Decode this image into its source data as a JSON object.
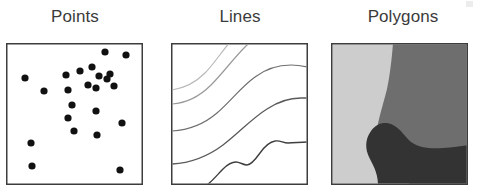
{
  "figure": {
    "background_color": "#ffffff",
    "width": 481,
    "height": 195,
    "panel_count": 3
  },
  "panels": [
    {
      "id": "points",
      "title": "Points",
      "title_color": "#3b3b3b",
      "frame_color": "#3d3d3d",
      "fill_color": "#ffffff",
      "geometry_type": "point",
      "marker_color": "#111111",
      "marker_radius": 3.6,
      "point_count": 24,
      "points": [
        [
          19,
          35
        ],
        [
          38,
          48
        ],
        [
          60,
          32
        ],
        [
          62,
          47
        ],
        [
          66,
          62
        ],
        [
          74,
          28
        ],
        [
          82,
          42
        ],
        [
          86,
          24
        ],
        [
          90,
          45
        ],
        [
          93,
          33
        ],
        [
          99,
          9
        ],
        [
          101,
          36
        ],
        [
          104,
          31
        ],
        [
          108,
          43
        ],
        [
          120,
          12
        ],
        [
          62,
          75
        ],
        [
          90,
          68
        ],
        [
          116,
          80
        ],
        [
          68,
          88
        ],
        [
          91,
          92
        ],
        [
          25,
          100
        ],
        [
          26,
          123
        ],
        [
          114,
          127
        ],
        [
          22,
          152
        ],
        [
          83,
          152
        ]
      ]
    },
    {
      "id": "lines",
      "title": "Lines",
      "title_color": "#3b3b3b",
      "frame_color": "#3d3d3d",
      "fill_color": "#ffffff",
      "geometry_type": "line",
      "line_count": 5,
      "lines": [
        {
          "name": "contour-1",
          "color": "#b9b9b9",
          "width": 1.2
        },
        {
          "name": "contour-2",
          "color": "#9a9a9a",
          "width": 1.2
        },
        {
          "name": "contour-3",
          "color": "#6f6f6f",
          "width": 1.2
        },
        {
          "name": "contour-4",
          "color": "#5a5a5a",
          "width": 1.3
        },
        {
          "name": "contour-5",
          "color": "#3f3f3f",
          "width": 1.4
        }
      ]
    },
    {
      "id": "polygons",
      "title": "Polygons",
      "title_color": "#3b3b3b",
      "frame_color": "#3d3d3d",
      "geometry_type": "polygon",
      "region_count": 3,
      "regions": [
        {
          "name": "light-region",
          "color": "#cdcdcd"
        },
        {
          "name": "medium-region",
          "color": "#6e6e6e"
        },
        {
          "name": "dark-region",
          "color": "#333333"
        }
      ]
    }
  ]
}
